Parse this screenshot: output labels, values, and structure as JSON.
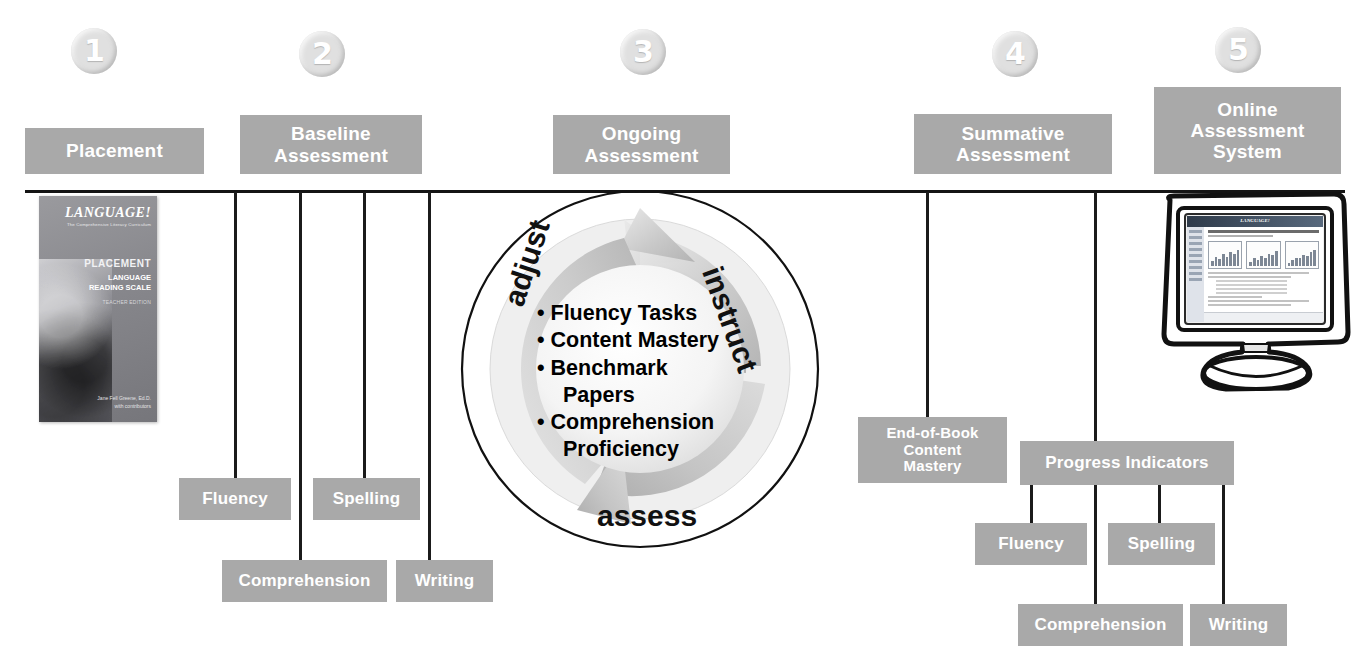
{
  "diagram": {
    "accent_gray": "#a9a9a9",
    "line_color": "#141414",
    "circle_gray": "#e0e0e0"
  },
  "steps": [
    {
      "number": "1",
      "label": "Placement"
    },
    {
      "number": "2",
      "label": "Baseline\nAssessment"
    },
    {
      "number": "3",
      "label": "Ongoing\nAssessment"
    },
    {
      "number": "4",
      "label": "Summative\nAssessment"
    },
    {
      "number": "5",
      "label": "Online\nAssessment\nSystem"
    }
  ],
  "headers": {
    "placement": "Placement",
    "baseline_line1": "Baseline",
    "baseline_line2": "Assessment",
    "ongoing_line1": "Ongoing",
    "ongoing_line2": "Assessment",
    "summative_line1": "Summative",
    "summative_line2": "Assessment",
    "online_line1": "Online",
    "online_line2": "Assessment",
    "online_line3": "System"
  },
  "book": {
    "brand": "LANGUAGE!",
    "tagline": "The Comprehensive Literacy Curriculum",
    "kind": "PLACEMENT",
    "series_line1": "LANGUAGE",
    "series_line2": "READING SCALE",
    "edition": "TEACHER EDITION",
    "author": "Jane Fell Greene, Ed.D.",
    "author_sub": "with contributors"
  },
  "baseline_children": [
    {
      "label": "Fluency"
    },
    {
      "label": "Comprehension"
    },
    {
      "label": "Spelling"
    },
    {
      "label": "Writing"
    }
  ],
  "cycle": {
    "words": {
      "instruct": "instruct",
      "assess": "assess",
      "adjust": "adjust"
    },
    "items": [
      "Fluency Tasks",
      "Content Mastery",
      "Benchmark",
      "Papers",
      "Comprehension",
      "Proficiency"
    ]
  },
  "summative": {
    "box_line1": "End-of-Book",
    "box_line2": "Content",
    "box_line3": "Mastery"
  },
  "online": {
    "progress_indicators": "Progress Indicators",
    "children": [
      {
        "label": "Fluency"
      },
      {
        "label": "Spelling"
      },
      {
        "label": "Comprehension"
      },
      {
        "label": "Writing"
      }
    ]
  }
}
